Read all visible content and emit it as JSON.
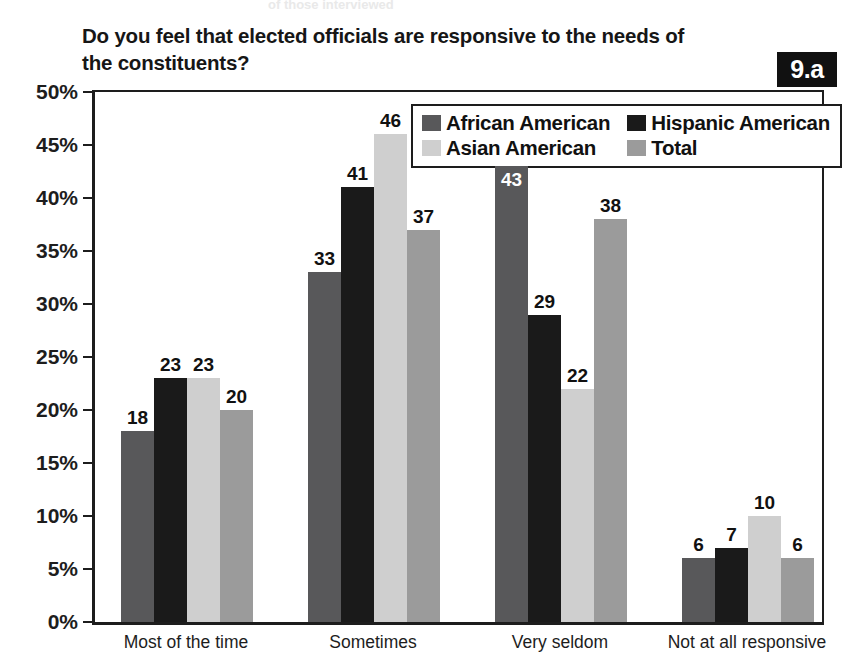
{
  "header": {
    "cropped_top_text": "of those interviewed",
    "figure_badge": "9.a"
  },
  "title": {
    "line1": "Do you feel that elected officials are responsive to the needs of",
    "line2": "the constituents?"
  },
  "colors": {
    "african_american": "#58585a",
    "hispanic_american": "#1a1a1a",
    "asian_american": "#cfcfcf",
    "total": "#9b9b9b",
    "axis": "#1d1d1d",
    "badge_bg": "#111111",
    "badge_text": "#ffffff",
    "plot_background": "#ffffff"
  },
  "chart_data": {
    "type": "bar",
    "title": "Do you feel that elected officials are responsive to the needs of the constituents?",
    "xlabel": "",
    "ylabel": "",
    "ylim": [
      0,
      50
    ],
    "ytick_step": 5,
    "ytick_labels": [
      "0%",
      "5%",
      "10%",
      "15%",
      "20%",
      "25%",
      "30%",
      "35%",
      "40%",
      "45%",
      "50%"
    ],
    "ytick_values": [
      0,
      5,
      10,
      15,
      20,
      25,
      30,
      35,
      40,
      45,
      50
    ],
    "grid": false,
    "legend_position": "inside-top-right",
    "value_suffix": "",
    "categories": [
      "Most of the time",
      "Sometimes",
      "Very seldom",
      "Not at all responsive"
    ],
    "series": [
      {
        "name": "African American",
        "color_key": "african_american",
        "values": [
          18,
          33,
          43,
          6
        ]
      },
      {
        "name": "Hispanic American",
        "color_key": "hispanic_american",
        "values": [
          23,
          41,
          29,
          7
        ]
      },
      {
        "name": "Asian American",
        "color_key": "asian_american",
        "values": [
          23,
          46,
          22,
          10
        ]
      },
      {
        "name": "Total",
        "color_key": "total",
        "values": [
          20,
          37,
          38,
          6
        ]
      }
    ]
  }
}
